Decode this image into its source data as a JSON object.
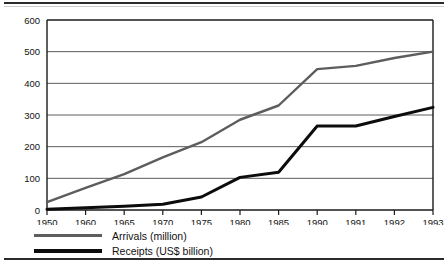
{
  "chart_data": {
    "type": "line",
    "title": "",
    "subtitle": "",
    "xlabel": "",
    "ylabel": "",
    "categories": [
      "1950",
      "1960",
      "1965",
      "1970",
      "1975",
      "1980",
      "1985",
      "1990",
      "1991",
      "1992",
      "1993"
    ],
    "ylim": [
      0,
      600
    ],
    "yticks": [
      0,
      100,
      200,
      300,
      400,
      500,
      600
    ],
    "ytick_labels": [
      "0",
      "100",
      "200",
      "300",
      "400",
      "500",
      "600"
    ],
    "grid": true,
    "grid_axis": "y",
    "legend_position": "bottom-left",
    "series": [
      {
        "name": "Arrivals (million)",
        "color": "#5d5d5d",
        "values": [
          25,
          70,
          113,
          166,
          214,
          285,
          330,
          445,
          455,
          480,
          500
        ]
      },
      {
        "name": "Receipts (US$ billion)",
        "color": "#0c0c0c",
        "values": [
          2,
          7,
          12,
          18,
          41,
          103,
          119,
          265,
          265,
          295,
          324
        ]
      }
    ]
  },
  "legend": {
    "items": [
      {
        "label": "Arrivals (million)",
        "swatch": "arrivals-line-swatch"
      },
      {
        "label": "Receipts (US$ billion)",
        "swatch": "receipts-line-swatch"
      }
    ]
  },
  "rules": {
    "top": "horizontal-rule",
    "bottom": "horizontal-rule"
  }
}
